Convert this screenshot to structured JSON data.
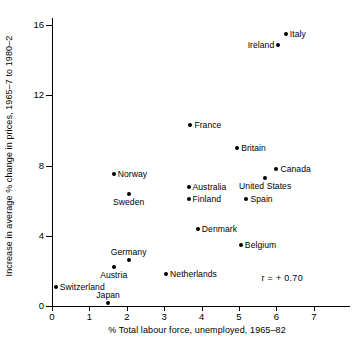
{
  "chart_data": {
    "type": "scatter",
    "title": "",
    "xlabel": "% Total labour force, unemployed, 1965–82",
    "ylabel": "Increase in average % change in prices, 1965–7 to 1980–2",
    "xlim": [
      0,
      8
    ],
    "ylim": [
      0,
      16.5
    ],
    "xticks": [
      0,
      1,
      2,
      3,
      4,
      5,
      6,
      7
    ],
    "xticklabels": [
      "0",
      "1",
      "2",
      "3",
      "4",
      "5",
      "6",
      "7"
    ],
    "yticks": [
      0,
      4,
      8,
      12,
      16
    ],
    "yticklabels": [
      "0",
      "4",
      "8",
      "12",
      "16"
    ],
    "grid": false,
    "legend": null,
    "annotations": [
      {
        "text": "r = + 0.70",
        "x": 5.6,
        "y": 1.9
      }
    ],
    "points": [
      {
        "name": "Italy",
        "x": 6.25,
        "y": 15.5,
        "label_pos": "right"
      },
      {
        "name": "Ireland",
        "x": 6.05,
        "y": 14.9,
        "label_pos": "left"
      },
      {
        "name": "France",
        "x": 3.7,
        "y": 10.3,
        "label_pos": "right"
      },
      {
        "name": "Britain",
        "x": 4.95,
        "y": 9.0,
        "label_pos": "right"
      },
      {
        "name": "Canada",
        "x": 6.0,
        "y": 7.8,
        "label_pos": "right"
      },
      {
        "name": "Norway",
        "x": 1.65,
        "y": 7.5,
        "label_pos": "right"
      },
      {
        "name": "United States",
        "x": 5.7,
        "y": 7.3,
        "label_pos": "below"
      },
      {
        "name": "Australia",
        "x": 3.65,
        "y": 6.8,
        "label_pos": "right"
      },
      {
        "name": "Sweden",
        "x": 2.05,
        "y": 6.4,
        "label_pos": "below"
      },
      {
        "name": "Finland",
        "x": 3.65,
        "y": 6.1,
        "label_pos": "right"
      },
      {
        "name": "Spain",
        "x": 5.2,
        "y": 6.1,
        "label_pos": "right"
      },
      {
        "name": "Denmark",
        "x": 3.9,
        "y": 4.4,
        "label_pos": "right"
      },
      {
        "name": "Belgium",
        "x": 5.05,
        "y": 3.5,
        "label_pos": "right"
      },
      {
        "name": "Germany",
        "x": 2.05,
        "y": 2.6,
        "label_pos": "above"
      },
      {
        "name": "Austria",
        "x": 1.65,
        "y": 2.2,
        "label_pos": "below"
      },
      {
        "name": "Netherlands",
        "x": 3.05,
        "y": 1.8,
        "label_pos": "right"
      },
      {
        "name": "Switzerland",
        "x": 0.1,
        "y": 1.1,
        "label_pos": "right"
      },
      {
        "name": "Japan",
        "x": 1.5,
        "y": 0.15,
        "label_pos": "above"
      }
    ]
  }
}
